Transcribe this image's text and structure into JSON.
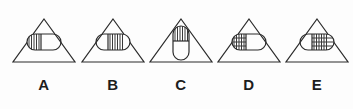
{
  "panel": {
    "background_color": "#fdfdfd",
    "stroke_color": "#2b2b2b",
    "hatch_color": "#3a3a3a",
    "label_color": "#1d1d1d"
  },
  "options": [
    {
      "label": "A",
      "name": "option-a",
      "container_shape": "triangle",
      "inner_shape": "capsule",
      "inner_orientation": "horizontal",
      "hatch_region": "left-half",
      "hatch_direction": "vertical-lines",
      "segments": 2
    },
    {
      "label": "B",
      "name": "option-b",
      "container_shape": "triangle",
      "inner_shape": "capsule",
      "inner_orientation": "horizontal",
      "hatch_region": "right-half",
      "hatch_direction": "vertical-lines",
      "segments": 2
    },
    {
      "label": "C",
      "name": "option-c",
      "container_shape": "triangle",
      "inner_shape": "capsule",
      "inner_orientation": "vertical",
      "hatch_region": "top-half",
      "hatch_direction": "vertical-lines",
      "segments": 2
    },
    {
      "label": "D",
      "name": "option-d",
      "container_shape": "triangle",
      "inner_shape": "capsule",
      "inner_orientation": "horizontal",
      "hatch_region": "left-half",
      "hatch_direction": "grid-lines",
      "segments": 2
    },
    {
      "label": "E",
      "name": "option-e",
      "container_shape": "triangle",
      "inner_shape": "capsule",
      "inner_orientation": "horizontal",
      "hatch_region": "right-half",
      "hatch_direction": "grid-lines",
      "segments": 2
    }
  ]
}
